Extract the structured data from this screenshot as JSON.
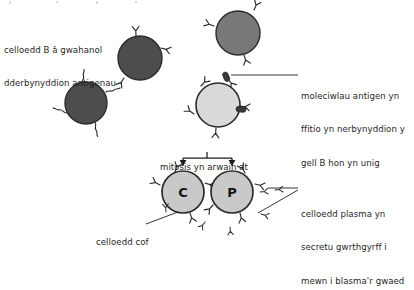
{
  "diagram": {
    "type": "immunology-clonal-selection",
    "language": "cy",
    "background_color": "#ffffff",
    "labels": {
      "b_cells": {
        "line1": "celloedd B â gwahanol",
        "line2": "dderbynyddion antigenau",
        "target": "b-cell-group"
      },
      "antigen": {
        "line1": "moleciwlau antigen yn",
        "line2": "ffitio yn nerbynyddion y",
        "line3": "gell B hon yn unig",
        "target": "selected-b-cell"
      },
      "mitosis": {
        "line1": "mitosis yn arwain at",
        "target": "daughter-cells"
      },
      "memory": {
        "line1": "celloedd cof",
        "target": "memory-cell"
      },
      "plasma": {
        "line1": "celloedd plasma yn",
        "line2": "secretu gwrthgyrff i",
        "line3": "mewn i blasma'r gwaed",
        "target": "plasma-cell"
      }
    },
    "cell_labels": {
      "memory": "C",
      "plasma": "P"
    },
    "colors": {
      "dark_cell_fill": "#4d4d4d",
      "mid_cell_fill": "#787878",
      "light_cell_fill": "#d9d9d9",
      "daughter_cell_fill": "#c9c9c9",
      "outline": "#2b2b2b",
      "antigen_fill": "#3a3a3a",
      "text": "#1f1f1f",
      "leader_line": "#1f1f1f"
    },
    "cells": [
      {
        "name": "b-cell-dark-upper",
        "cx": 238,
        "cy": 33,
        "r": 22,
        "fill": "mid_cell_fill",
        "receptor_style": "y-shape"
      },
      {
        "name": "b-cell-dark-middle",
        "cx": 140,
        "cy": 58,
        "r": 22,
        "fill": "dark_cell_fill",
        "receptor_style": "y-shape"
      },
      {
        "name": "b-cell-dark-lower",
        "cx": 86,
        "cy": 103,
        "r": 21,
        "fill": "dark_cell_fill",
        "receptor_style": "squiggle"
      },
      {
        "name": "selected-b-cell",
        "cx": 218,
        "cy": 105,
        "r": 22,
        "fill": "light_cell_fill",
        "receptor_style": "y-shape"
      },
      {
        "name": "memory-cell",
        "cx": 183,
        "cy": 192,
        "r": 21,
        "fill": "daughter_cell_fill",
        "receptor_style": "y-shape"
      },
      {
        "name": "plasma-cell",
        "cx": 232,
        "cy": 192,
        "r": 21,
        "fill": "daughter_cell_fill",
        "receptor_style": "y-shape"
      }
    ],
    "antigens": [
      {
        "name": "antigen-molecule-top",
        "x": 227,
        "y": 76,
        "angle": -25
      },
      {
        "name": "antigen-molecule-right",
        "x": 239,
        "y": 110,
        "angle": 8
      }
    ],
    "antibody_count": 6
  }
}
